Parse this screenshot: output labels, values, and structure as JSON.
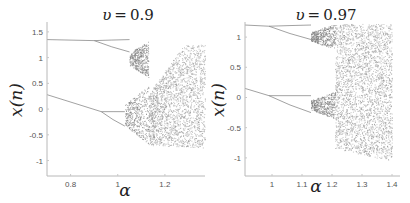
{
  "chart_data": [
    {
      "type": "scatter",
      "subtype": "bifurcation-diagram",
      "title": "υ = 0.9",
      "title_var": "υ",
      "title_value": "0.9",
      "xlabel": "α",
      "ylabel": "x(n)",
      "xlim": [
        0.7,
        1.37
      ],
      "ylim": [
        -1.3,
        1.75
      ],
      "xticks": [
        0.8,
        1,
        1.2
      ],
      "xtick_labels": [
        "0.8",
        "1",
        "1.2"
      ],
      "yticks": [
        1.5,
        1,
        0.5,
        0,
        -0.5,
        -1
      ],
      "ytick_labels": [
        "1.5",
        "1",
        "0.5",
        "0",
        "-0.5",
        "-1"
      ],
      "grid": false,
      "branches": {
        "upper": {
          "start": [
            0.7,
            1.35
          ],
          "split_alpha": 0.9,
          "split_value": 1.33,
          "chaos_start": 1.05,
          "chaos_end": 1.13,
          "chaos_range": [
            0.62,
            1.32
          ]
        },
        "lower": {
          "start": [
            0.7,
            0.28
          ],
          "split_alpha": 0.93,
          "split_value": -0.05,
          "chaos_start": 1.03,
          "chaos_range": [
            -0.68,
            0.45
          ]
        },
        "full_chaos": {
          "alpha_range": [
            1.13,
            1.37
          ],
          "y_range": [
            -0.75,
            1.25
          ]
        }
      }
    },
    {
      "type": "scatter",
      "subtype": "bifurcation-diagram",
      "title": "υ = 0.97",
      "title_var": "υ",
      "title_value": "0.97",
      "xlabel": "α",
      "ylabel": "x(n)",
      "xlim": [
        0.91,
        1.4
      ],
      "ylim": [
        -1.3,
        1.25
      ],
      "xticks": [
        1,
        1.1,
        1.2,
        1.3,
        1.4
      ],
      "xtick_labels": [
        "1",
        "1.1",
        "1.2",
        "1.3",
        "1.4"
      ],
      "yticks": [
        1,
        0.5,
        0,
        -0.5,
        -1
      ],
      "ytick_labels": [
        "1",
        "0.5",
        "0",
        "-0.5",
        "-1"
      ],
      "grid": false,
      "branches": {
        "upper": {
          "start": [
            0.91,
            1.2
          ],
          "split_alpha": 0.99,
          "split_value": 1.18,
          "chaos_start": 1.13,
          "chaos_range": [
            0.8,
            1.22
          ]
        },
        "lower": {
          "start": [
            0.91,
            0.15
          ],
          "split_alpha": 0.99,
          "split_value": 0.03,
          "chaos_start": 1.13,
          "chaos_range": [
            -0.35,
            0.1
          ]
        },
        "full_chaos": {
          "alpha_range": [
            1.21,
            1.4
          ],
          "y_range": [
            -1.05,
            1.22
          ]
        }
      }
    }
  ]
}
